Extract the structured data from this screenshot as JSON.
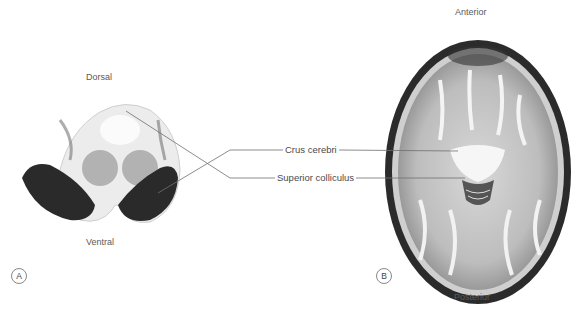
{
  "panel_a": {
    "letter": "A",
    "top_label": "Dorsal",
    "bottom_label": "Ventral",
    "image": "histological-section-midbrain"
  },
  "panel_b": {
    "letter": "B",
    "top_label": "Anterior",
    "bottom_label": "Posterior",
    "image": "axial-mri-brain"
  },
  "callouts": [
    {
      "label": "Crus cerebri"
    },
    {
      "label": "Superior colliculus"
    }
  ],
  "colors": {
    "leader_line": "#6e6e6e",
    "text": "#555555"
  }
}
